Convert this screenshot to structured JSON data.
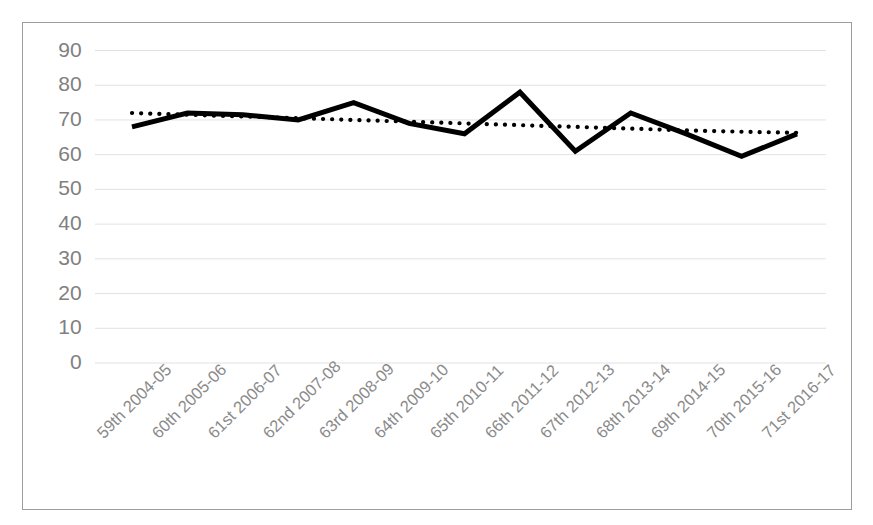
{
  "chart_data": {
    "type": "line",
    "title": "",
    "subtitle": "",
    "xlabel": "",
    "ylabel": "",
    "ylim": [
      0,
      90
    ],
    "yticks": [
      0,
      10,
      20,
      30,
      40,
      50,
      60,
      70,
      80,
      90
    ],
    "grid": true,
    "legend": "none",
    "categories": [
      "59th 2004-05",
      "60th 2005-06",
      "61st 2006-07",
      "62nd 2007-08",
      "63rd 2008-09",
      "64th 2009-10",
      "65th 2010-11",
      "66th 2011-12",
      "67th 2012-13",
      "68th 2013-14",
      "69th 2014-15",
      "70th 2015-16",
      "71st 2016-17"
    ],
    "series": [
      {
        "name": "Value",
        "style": "solid",
        "color": "#000000",
        "values": [
          68,
          72,
          71.5,
          70,
          75,
          69,
          66,
          78,
          61,
          72,
          66,
          59.5,
          66
        ]
      },
      {
        "name": "Linear trend",
        "style": "dotted",
        "color": "#000000",
        "values": [
          72,
          71.5,
          71,
          70.5,
          70,
          69.5,
          69,
          68.5,
          68,
          67.5,
          67,
          66.6,
          66.3
        ]
      }
    ]
  },
  "style": {
    "grid_color": "#e2e2e2",
    "frame_color": "#9d9d9d",
    "tick_label_color": "#808080",
    "plot_background": "#ffffff"
  }
}
